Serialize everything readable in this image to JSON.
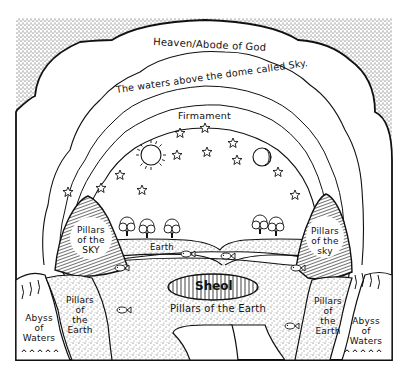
{
  "diagram": {
    "kind": "ancient-cosmology-illustration",
    "colors": {
      "ink": "#111111",
      "paper": "#ffffff",
      "stipple": "#9a9a9a"
    },
    "labels": {
      "heaven": "Heaven/Abode of God",
      "waters_above": "The waters above the dome called Sky.",
      "firmament": "Firmament",
      "earth": "Earth",
      "sheol": "Sheol",
      "pillars_of_the_earth_center": "Pillars of the Earth",
      "pillars_sky_left": [
        "Pillars",
        "of the",
        "SKY"
      ],
      "pillars_sky_right": [
        "Pillars",
        "of the",
        "sky"
      ],
      "pillars_earth_left": [
        "Pillars",
        "of",
        "the",
        "Earth"
      ],
      "pillars_earth_right": [
        "Pillars",
        "of",
        "the",
        "Earth"
      ],
      "abyss_left": [
        "Abyss",
        "of",
        "Waters"
      ],
      "abyss_right": [
        "Abyss",
        "of",
        "Waters"
      ]
    },
    "icons": {
      "sun": "sun-icon",
      "moon": "crescent-moon-icon",
      "stars": "star-icon",
      "trees": "tree-icon",
      "fish": "fish-icon"
    },
    "star_count": 12,
    "tree_count": 5,
    "fish_count": 6
  }
}
